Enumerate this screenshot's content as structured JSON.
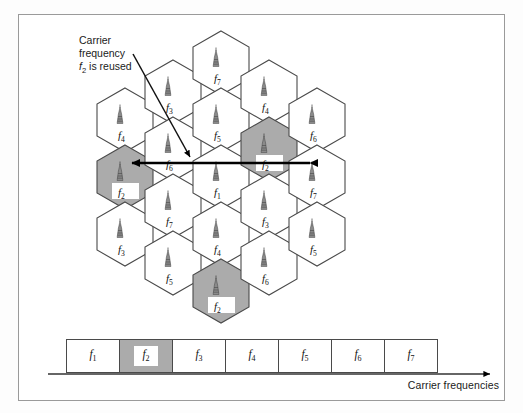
{
  "figure": {
    "annotation_line1": "Carrier",
    "annotation_line2": "frequency",
    "annotation_line3_pre": "f",
    "annotation_line3_sub": "2",
    "annotation_line3_post": " is reused",
    "axis_label": "Carrier frequencies",
    "colors": {
      "highlight_gray": "#ababab",
      "cell_stroke": "#4a4a4a",
      "cell_fill": "#ffffff",
      "arrow": "#000000",
      "frame": "#9a9a9a"
    }
  },
  "hex_grid": {
    "icon": "antenna-tower-icon",
    "cells": [
      {
        "id": "c1",
        "label": "f",
        "sub": "4",
        "cx": 125,
        "cy": 120,
        "highlight": false
      },
      {
        "id": "c2",
        "label": "f",
        "sub": "2",
        "cx": 125,
        "cy": 177,
        "highlight": true
      },
      {
        "id": "c3",
        "label": "f",
        "sub": "3",
        "cx": 125,
        "cy": 234,
        "highlight": false
      },
      {
        "id": "c4",
        "label": "f",
        "sub": "3",
        "cx": 173,
        "cy": 92,
        "highlight": false
      },
      {
        "id": "c5",
        "label": "f",
        "sub": "6",
        "cx": 173,
        "cy": 149,
        "highlight": false
      },
      {
        "id": "c6",
        "label": "f",
        "sub": "7",
        "cx": 173,
        "cy": 206,
        "highlight": false
      },
      {
        "id": "c7",
        "label": "f",
        "sub": "5",
        "cx": 173,
        "cy": 263,
        "highlight": false
      },
      {
        "id": "c8",
        "label": "f",
        "sub": "7",
        "cx": 221,
        "cy": 63,
        "highlight": false
      },
      {
        "id": "c9",
        "label": "f",
        "sub": "5",
        "cx": 221,
        "cy": 120,
        "highlight": false
      },
      {
        "id": "c10",
        "label": "f",
        "sub": "1",
        "cx": 221,
        "cy": 177,
        "highlight": false
      },
      {
        "id": "c11",
        "label": "f",
        "sub": "4",
        "cx": 221,
        "cy": 234,
        "highlight": false
      },
      {
        "id": "c12",
        "label": "f",
        "sub": "2",
        "cx": 221,
        "cy": 291,
        "highlight": true
      },
      {
        "id": "c13",
        "label": "f",
        "sub": "4",
        "cx": 269,
        "cy": 92,
        "highlight": false
      },
      {
        "id": "c14",
        "label": "f",
        "sub": "2",
        "cx": 269,
        "cy": 149,
        "highlight": true
      },
      {
        "id": "c15",
        "label": "f",
        "sub": "3",
        "cx": 269,
        "cy": 206,
        "highlight": false
      },
      {
        "id": "c16",
        "label": "f",
        "sub": "6",
        "cx": 269,
        "cy": 263,
        "highlight": false
      },
      {
        "id": "c17",
        "label": "f",
        "sub": "6",
        "cx": 317,
        "cy": 120,
        "highlight": false
      },
      {
        "id": "c18",
        "label": "f",
        "sub": "7",
        "cx": 317,
        "cy": 177,
        "highlight": false
      },
      {
        "id": "c19",
        "label": "f",
        "sub": "5",
        "cx": 317,
        "cy": 234,
        "highlight": false
      }
    ]
  },
  "reuse_arrow": {
    "name": "reuse-distance-arrow",
    "from_x": 310,
    "from_y": 163,
    "to_x": 132,
    "to_y": 163
  },
  "pointer_arrow": {
    "name": "annotation-pointer-arrow",
    "from_x": 133,
    "from_y": 54,
    "to_x": 190,
    "to_y": 157
  },
  "frequency_bar": {
    "cells": [
      {
        "label": "f",
        "sub": "1",
        "highlight": false
      },
      {
        "label": "f",
        "sub": "2",
        "highlight": true
      },
      {
        "label": "f",
        "sub": "3",
        "highlight": false
      },
      {
        "label": "f",
        "sub": "4",
        "highlight": false
      },
      {
        "label": "f",
        "sub": "5",
        "highlight": false
      },
      {
        "label": "f",
        "sub": "6",
        "highlight": false
      },
      {
        "label": "f",
        "sub": "7",
        "highlight": false
      }
    ],
    "axis": {
      "x1": 48,
      "x2": 490,
      "y": 374
    }
  }
}
